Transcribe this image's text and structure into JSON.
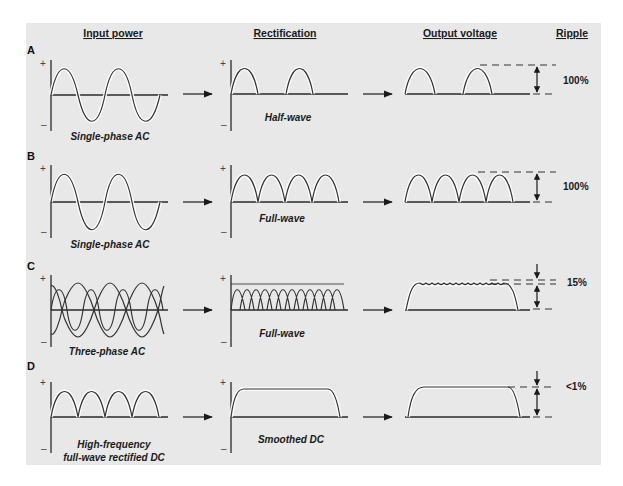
{
  "headers": {
    "input": "Input power",
    "rectification": "Rectification",
    "output": "Output voltage",
    "ripple": "Ripple"
  },
  "axis_signs": {
    "plus": "+",
    "minus": "–"
  },
  "rows": [
    {
      "label": "A",
      "input_caption": "Single-phase AC",
      "rect_caption": "Half-wave",
      "ripple": "100%"
    },
    {
      "label": "B",
      "input_caption": "Single-phase AC",
      "rect_caption": "Full-wave",
      "ripple": "100%"
    },
    {
      "label": "C",
      "input_caption": "Three-phase AC",
      "rect_caption": "Full-wave",
      "ripple": "15%"
    },
    {
      "label": "D",
      "input_caption_line1": "High-frequency",
      "input_caption_line2": "full-wave rectified DC",
      "rect_caption": "Smoothed DC",
      "ripple": "<1%"
    }
  ],
  "colors": {
    "panel": "#e8e8e8",
    "line": "#333333",
    "glow": "#ffffff"
  }
}
